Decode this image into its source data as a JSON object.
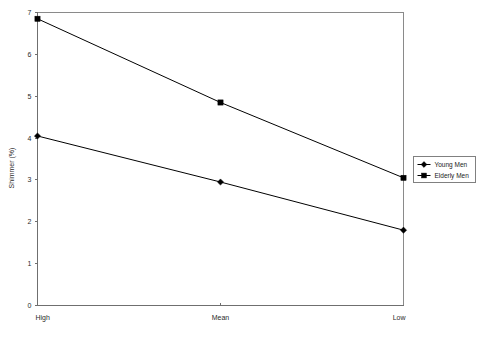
{
  "chart_data": {
    "type": "line",
    "title": "",
    "subtitle": "",
    "xlabel": "",
    "ylabel": "Shimmer (%)",
    "categories": [
      "High",
      "Mean",
      "Low"
    ],
    "ylim": [
      0,
      7
    ],
    "yticks": [
      0,
      1,
      2,
      3,
      4,
      5,
      6,
      7
    ],
    "ytick_labels": [
      "0",
      "1",
      "2",
      "3",
      "4",
      "5",
      "6",
      "7"
    ],
    "grid": false,
    "legend_position": "right",
    "series": [
      {
        "name": "Young Men",
        "marker": "diamond",
        "color": "#000000",
        "values": [
          4.05,
          2.95,
          1.8
        ]
      },
      {
        "name": "Elderly Men",
        "marker": "square",
        "color": "#000000",
        "values": [
          6.85,
          4.85,
          3.05
        ]
      }
    ]
  },
  "legend": {
    "entries": [
      {
        "label": "Young Men"
      },
      {
        "label": "Elderly Men"
      }
    ]
  },
  "axes": {
    "y_title": "Shimmer (%)",
    "x_categories": [
      "High",
      "Mean",
      "Low"
    ],
    "y_tick_labels": [
      "0",
      "1",
      "2",
      "3",
      "4",
      "5",
      "6",
      "7"
    ]
  }
}
